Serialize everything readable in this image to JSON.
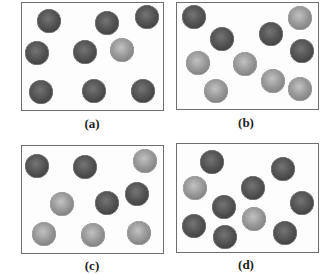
{
  "figure": {
    "colors": {
      "dark_particle": "#4a4a4a",
      "light_particle": "#8e8e8e",
      "box_border": "#6e6e6e"
    },
    "panels": [
      {
        "label": "(a)",
        "box": {
          "left": 21,
          "top": 2,
          "width": 143,
          "height": 109
        },
        "label_pos": {
          "x": 92,
          "y": 124
        },
        "particles": [
          {
            "x": 49,
            "y": 21,
            "type": "dark"
          },
          {
            "x": 107,
            "y": 23,
            "type": "dark"
          },
          {
            "x": 147,
            "y": 17,
            "type": "dark"
          },
          {
            "x": 37,
            "y": 53,
            "type": "dark"
          },
          {
            "x": 85,
            "y": 52,
            "type": "dark"
          },
          {
            "x": 122,
            "y": 50,
            "type": "light"
          },
          {
            "x": 41,
            "y": 92,
            "type": "dark"
          },
          {
            "x": 94,
            "y": 91,
            "type": "dark"
          },
          {
            "x": 143,
            "y": 91,
            "type": "dark"
          }
        ]
      },
      {
        "label": "(b)",
        "box": {
          "left": 176,
          "top": 2,
          "width": 143,
          "height": 108
        },
        "label_pos": {
          "x": 246,
          "y": 123
        },
        "particles": [
          {
            "x": 194,
            "y": 17,
            "type": "dark"
          },
          {
            "x": 300,
            "y": 18,
            "type": "light"
          },
          {
            "x": 222,
            "y": 39,
            "type": "dark"
          },
          {
            "x": 271,
            "y": 34,
            "type": "dark"
          },
          {
            "x": 302,
            "y": 51,
            "type": "dark"
          },
          {
            "x": 198,
            "y": 63,
            "type": "light"
          },
          {
            "x": 245,
            "y": 64,
            "type": "light"
          },
          {
            "x": 273,
            "y": 81,
            "type": "light"
          },
          {
            "x": 300,
            "y": 89,
            "type": "light"
          },
          {
            "x": 216,
            "y": 91,
            "type": "light"
          }
        ]
      },
      {
        "label": "(c)",
        "box": {
          "left": 21,
          "top": 145,
          "width": 143,
          "height": 109
        },
        "label_pos": {
          "x": 92,
          "y": 266
        },
        "particles": [
          {
            "x": 37,
            "y": 166,
            "type": "dark"
          },
          {
            "x": 85,
            "y": 167,
            "type": "dark"
          },
          {
            "x": 145,
            "y": 161,
            "type": "light"
          },
          {
            "x": 62,
            "y": 204,
            "type": "light"
          },
          {
            "x": 107,
            "y": 203,
            "type": "dark"
          },
          {
            "x": 137,
            "y": 194,
            "type": "dark"
          },
          {
            "x": 44,
            "y": 234,
            "type": "light"
          },
          {
            "x": 93,
            "y": 235,
            "type": "light"
          },
          {
            "x": 139,
            "y": 233,
            "type": "light"
          }
        ]
      },
      {
        "label": "(d)",
        "box": {
          "left": 176,
          "top": 143,
          "width": 143,
          "height": 110
        },
        "label_pos": {
          "x": 246,
          "y": 265
        },
        "particles": [
          {
            "x": 212,
            "y": 162,
            "type": "dark"
          },
          {
            "x": 283,
            "y": 169,
            "type": "dark"
          },
          {
            "x": 195,
            "y": 188,
            "type": "light"
          },
          {
            "x": 253,
            "y": 188,
            "type": "dark"
          },
          {
            "x": 302,
            "y": 203,
            "type": "dark"
          },
          {
            "x": 224,
            "y": 207,
            "type": "dark"
          },
          {
            "x": 254,
            "y": 219,
            "type": "light"
          },
          {
            "x": 194,
            "y": 226,
            "type": "dark"
          },
          {
            "x": 225,
            "y": 237,
            "type": "dark"
          },
          {
            "x": 285,
            "y": 233,
            "type": "dark"
          }
        ]
      }
    ]
  }
}
